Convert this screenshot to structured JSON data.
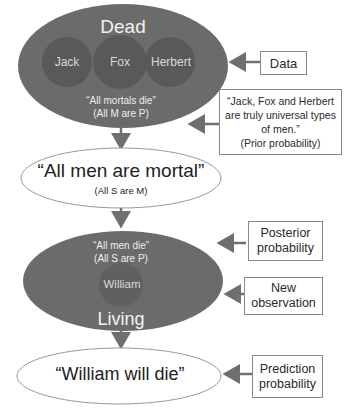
{
  "diagram": {
    "dead_ellipse": {
      "title": "Dead",
      "circles": [
        "Jack",
        "Fox",
        "Herbert"
      ],
      "statement": "“All mortals die”",
      "formula": "(All M are P)",
      "fill": "#6b6b6b"
    },
    "men_mortal_ellipse": {
      "statement": "“All men are mortal”",
      "formula": "(All S are M)"
    },
    "living_ellipse": {
      "statement": "“All men die”",
      "formula": "(All S are P)",
      "circle": "William",
      "title": "Living",
      "fill": "#6b6b6b"
    },
    "prediction_ellipse": {
      "statement": "“William will die”"
    },
    "labels": {
      "data": "Data",
      "prior": [
        "“Jack, Fox and Herbert",
        "are truly universal types",
        "of men.”",
        "(Prior probability)"
      ],
      "posterior": [
        "Posterior",
        "probability"
      ],
      "new_observation": [
        "New",
        "observation"
      ],
      "prediction": [
        "Prediction",
        "probability"
      ]
    }
  }
}
